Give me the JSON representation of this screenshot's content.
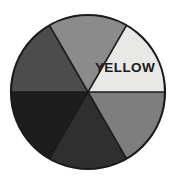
{
  "figure": {
    "name": "color-wheel",
    "background_color": "#ffffff",
    "width": 178,
    "height": 191
  },
  "chart_data": {
    "type": "pie",
    "title": "",
    "subtitle": "",
    "xlabel": "",
    "ylabel": "",
    "legend_position": "none",
    "grid": false,
    "center_x": 88,
    "center_y": 92,
    "radius": 77,
    "outline_color": "#1a1a1a",
    "outline_width": 2.2,
    "divider_color": "#1a1a1a",
    "divider_width": 1.6,
    "start_angle_deg": 0,
    "categories": [
      "upper-right",
      "top",
      "upper-left",
      "lower-left",
      "bottom",
      "lower-right"
    ],
    "values": [
      1,
      1,
      1,
      1,
      1,
      1
    ],
    "slice_angle_deg": 60,
    "labels": [
      "YELLOW",
      "",
      "",
      "",
      "",
      ""
    ],
    "colors": [
      "#e8e8e6",
      "#8b8b8b",
      "#4c4c4c",
      "#1d1d1d",
      "#2f2f2f",
      "#7e7e7e"
    ],
    "slices": [
      {
        "id": "slice-upper-right",
        "label": "YELLOW",
        "label_color": "#1a1a1a",
        "color": "#e8e8e6",
        "start_deg": -60,
        "end_deg": 0,
        "label_x": 125,
        "label_y": 68
      },
      {
        "id": "slice-top",
        "label": "",
        "label_color": "#1a1a1a",
        "color": "#8b8b8b",
        "start_deg": -120,
        "end_deg": -60,
        "label_x": 88,
        "label_y": 40
      },
      {
        "id": "slice-upper-left",
        "label": "",
        "label_color": "#ffffff",
        "color": "#4c4c4c",
        "start_deg": -180,
        "end_deg": -120,
        "label_x": 51,
        "label_y": 68
      },
      {
        "id": "slice-lower-left",
        "label": "",
        "label_color": "#ffffff",
        "color": "#1d1d1d",
        "start_deg": 120,
        "end_deg": 180,
        "label_x": 51,
        "label_y": 116
      },
      {
        "id": "slice-bottom",
        "label": "",
        "label_color": "#ffffff",
        "color": "#2f2f2f",
        "start_deg": 60,
        "end_deg": 120,
        "label_x": 88,
        "label_y": 144
      },
      {
        "id": "slice-lower-right",
        "label": "",
        "label_color": "#1a1a1a",
        "color": "#7e7e7e",
        "start_deg": 0,
        "end_deg": 60,
        "label_x": 125,
        "label_y": 116
      }
    ]
  }
}
